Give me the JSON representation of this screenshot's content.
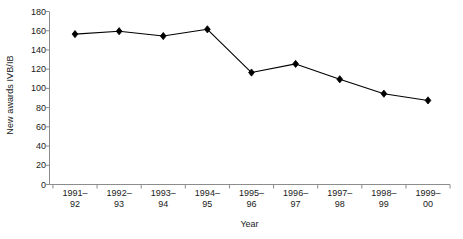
{
  "chart_data": {
    "type": "line",
    "title": "",
    "subtitle": "",
    "xlabel": "Year",
    "ylabel": "New awards IVB/IB",
    "categories": [
      "1991–92",
      "1992–93",
      "1993–94",
      "1994–95",
      "1995–96",
      "1996–97",
      "1997–98",
      "1998–99",
      "1999–00"
    ],
    "category_lines": [
      [
        "1991–",
        "92"
      ],
      [
        "1992–",
        "93"
      ],
      [
        "1993–",
        "94"
      ],
      [
        "1994–",
        "95"
      ],
      [
        "1995–",
        "96"
      ],
      [
        "1996–",
        "97"
      ],
      [
        "1997–",
        "98"
      ],
      [
        "1998–",
        "99"
      ],
      [
        "1999–",
        "00"
      ]
    ],
    "values": [
      157,
      160,
      155,
      162,
      117,
      126,
      110,
      95,
      88
    ],
    "ylim": [
      0,
      180
    ],
    "yticks": [
      0,
      20,
      40,
      60,
      80,
      100,
      120,
      140,
      160,
      180
    ],
    "ytick_labels": [
      "0",
      "20",
      "40",
      "60",
      "80",
      "100",
      "120",
      "140",
      "160",
      "180"
    ],
    "grid": false,
    "legend": false,
    "legend_position": "none",
    "marker": "diamond",
    "series": [
      {
        "name": "New awards IVB/IB",
        "values": [
          157,
          160,
          155,
          162,
          117,
          126,
          110,
          95,
          88
        ],
        "color": "#000000",
        "marker_color": "#000000"
      }
    ],
    "colors": {
      "line": "#000000",
      "marker": "#000000",
      "axis": "#8c8c8c",
      "text": "#1a1a1a",
      "background": "#ffffff"
    }
  }
}
